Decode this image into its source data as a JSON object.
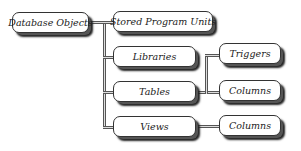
{
  "diagram": {
    "root": "Database Objects",
    "nodes": {
      "database_objects": "Database Objects",
      "stored_program_units": "Stored Program Units",
      "libraries": "Libraries",
      "tables": "Tables",
      "views": "Views",
      "triggers": "Triggers",
      "table_columns": "Columns",
      "view_columns": "Columns"
    },
    "edges": [
      [
        "Database Objects",
        "Stored Program Units"
      ],
      [
        "Database Objects",
        "Libraries"
      ],
      [
        "Database Objects",
        "Tables"
      ],
      [
        "Database Objects",
        "Views"
      ],
      [
        "Tables",
        "Triggers"
      ],
      [
        "Tables",
        "Columns"
      ],
      [
        "Views",
        "Columns"
      ]
    ]
  }
}
